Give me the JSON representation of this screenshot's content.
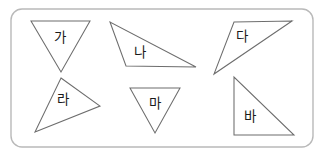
{
  "panel": {
    "name": "triangle-worksheet-panel",
    "border_color": "#b9b9b9",
    "background_color": "#ffffff",
    "x": 11,
    "y": 9,
    "width": 302,
    "height": 138,
    "corner_radius": 11
  },
  "style": {
    "shape_stroke_color": "#6d6d6d",
    "shape_fill_color": "#ffffff",
    "label_color": "#1a1a1a"
  },
  "shapes": [
    {
      "id": "triangle-ga",
      "label": "가",
      "points": "31,21 90,21 61,72",
      "label_x": 60,
      "label_y": 38
    },
    {
      "id": "triangle-na",
      "label": "나",
      "points": "110,22 126,66 196,67",
      "label_x": 140,
      "label_y": 53
    },
    {
      "id": "triangle-da",
      "label": "다",
      "points": "234,22 292,21 214,74",
      "label_x": 242,
      "label_y": 37
    },
    {
      "id": "triangle-ra",
      "label": "라",
      "points": "61,78 100,106 35,132",
      "label_x": 63,
      "label_y": 100
    },
    {
      "id": "triangle-ma",
      "label": "마",
      "points": "130,88 180,88 155,133",
      "label_x": 155,
      "label_y": 104
    },
    {
      "id": "triangle-ba",
      "label": "바",
      "points": "234,77 234,135 294,135",
      "label_x": 250,
      "label_y": 117
    }
  ]
}
